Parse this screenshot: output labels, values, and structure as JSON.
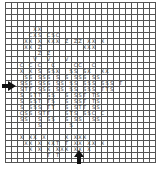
{
  "chart": {
    "title": "",
    "cell_px": 6,
    "columns": 25,
    "rows": 26,
    "center_markers": {
      "left_arrow_row": 13,
      "bottom_arrow_col": 12
    },
    "symbols": [
      "S",
      "X",
      "T",
      "C",
      "Z",
      "V"
    ],
    "rows_data": [
      {
        "row": 4,
        "text": "        X X          "
      },
      {
        "row": 5,
        "text": "      C X S C S C    "
      },
      {
        "row": 6,
        "text": "     X X X  X X X  Z Z Z  X X X"
      },
      {
        "row": 7,
        "text": "     X X Z              X X X"
      },
      {
        "row": 8,
        "text": "          Z Z             "
      },
      {
        "row": 9,
        "text": "        V    V    V     "
      },
      {
        "row": 10,
        "text": "   C   C C    C      C C   C"
      },
      {
        "row": 11,
        "text": "    X X   S S S X   S S S X   X X"
      },
      {
        "row": 12,
        "text": "     S S S S S S   S S S S S S"
      },
      {
        "row": 13,
        "text": "   S S S S S S S S  S S S S S S S S T"
      },
      {
        "row": 14,
        "text": "   S T T S S S S S  S S S S S T T S"
      },
      {
        "row": 15,
        "text": "    S S T T S S    S S S T T S"
      },
      {
        "row": 16,
        "text": "    S S S T T S    S S S T T S"
      },
      {
        "row": 17,
        "text": "    S S S S T T    S S T T S S"
      },
      {
        "row": 18,
        "text": "   C S S S T T    S T S S S C C"
      },
      {
        "row": 19,
        "text": "   S S    S S S    S S S   S S"
      },
      {
        "row": 20,
        "text": "          S         S"
      },
      {
        "row": 22,
        "text": "    X X X  X       X X X X"
      },
      {
        "row": 23,
        "text": "     X X X  X X T  T X X  X X X"
      },
      {
        "row": 24,
        "text": "       X  X  X X X X X X  X"
      },
      {
        "row": 25,
        "text": "             T  T"
      }
    ]
  }
}
